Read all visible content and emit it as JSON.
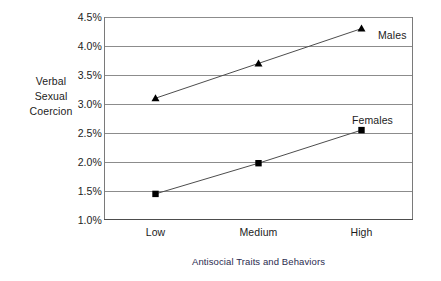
{
  "chart_data": {
    "type": "line",
    "title": "",
    "xlabel": "Antisocial Traits and Behaviors",
    "ylabel": "Verbal Sexual Coercion",
    "categories": [
      "Low",
      "Medium",
      "High"
    ],
    "series": [
      {
        "name": "Males",
        "values": [
          3.1,
          3.7,
          4.3
        ],
        "marker": "triangle"
      },
      {
        "name": "Females",
        "values": [
          1.45,
          1.98,
          2.55
        ],
        "marker": "square"
      }
    ],
    "ylim": [
      1.0,
      4.5
    ],
    "yticks": [
      "1.0%",
      "1.5%",
      "2.0%",
      "2.5%",
      "3.0%",
      "3.5%",
      "4.0%",
      "4.5%"
    ],
    "ytick_values": [
      1.0,
      1.5,
      2.0,
      2.5,
      3.0,
      3.5,
      4.0,
      4.5
    ],
    "grid": true,
    "legend_position": "inline-right",
    "value_suffix": "%",
    "line_color": "#4d4d4d",
    "marker_color": "#000000",
    "grid_color": "#8c8c8c",
    "axis_color": "#7a7a7a"
  },
  "axis": {
    "y_title_lines": [
      "Verbal",
      "Sexual",
      "Coercion"
    ]
  }
}
